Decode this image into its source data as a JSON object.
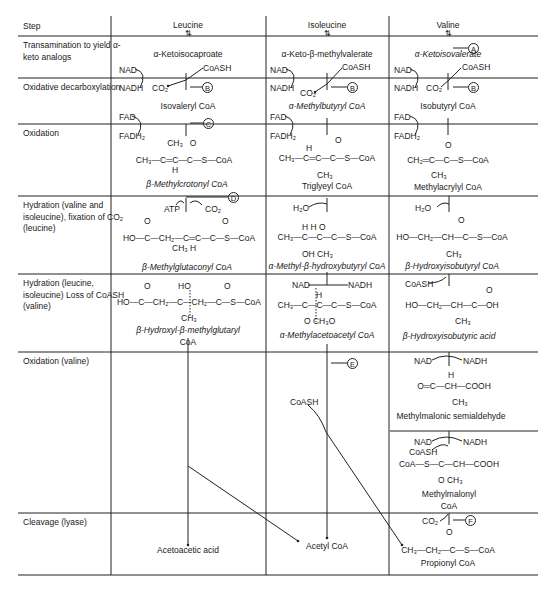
{
  "header": {
    "step": "Step",
    "columns": [
      "Leucine",
      "Isoleucine",
      "Valine"
    ]
  },
  "steps": [
    "Transamination to yield α-keto analogs",
    "Oxidative decarboxylation",
    "Oxidation",
    "Hydration (valine and isoleucine), fixation of CO₂ (leucine)",
    "Hydration (leucine, isoleucine) Loss of CoASH (valine)",
    "Oxidation (valine)",
    "Cleavage (lyase)"
  ],
  "markers": [
    "A",
    "B",
    "C",
    "D",
    "E",
    "F"
  ],
  "cofactors": {
    "nad": "NAD",
    "nadh": "NADH",
    "coash": "CoASH",
    "co2": "CO₂",
    "fad": "FAD",
    "fadh2": "FADH₂",
    "atp": "ATP",
    "h2o": "H₂O"
  },
  "leucine": {
    "keto": "α-Ketoisocaproate",
    "decarb": "Isovaleryl CoA",
    "oxid_struct": [
      "CH₃",
      "O",
      "CH₃—C═C—C—S—CoA",
      "H"
    ],
    "oxid": "β-Methylcrotonyl CoA",
    "hyd_struct": [
      "O",
      "O",
      "HO—C—CH₂—C═C—C—S—CoA",
      "CH₃  H"
    ],
    "hyd": "β-Methylglutaconyl CoA",
    "hmg_struct": [
      "O",
      "HO",
      "O",
      "HO—C—CH₂—C—CH₂—C—S—CoA",
      "CH₃"
    ],
    "hmg": "β-Hydroxyl-β-methylglutaryl",
    "hmg2": "CoA",
    "cleave": "Acetoacetic acid"
  },
  "isoleucine": {
    "keto": "α-Keto-β-methylvalerate",
    "decarb": "α-Methylbutyryl CoA",
    "oxid_struct": [
      "H",
      "O",
      "CH₃—C═C—C—S—CoA",
      "CH₃"
    ],
    "oxid": "Triglyeyl CoA",
    "hyd_struct": [
      "H   H   O",
      "CH₃—C—C—C—S—CoA",
      "OH CH₃"
    ],
    "hyd": "α-Methyl-β-hydroxybutyryl CoA",
    "mac_struct": [
      "H",
      "CH₃—C—C—C—S—CoA",
      "O  CH₃O"
    ],
    "mac": "α-Methylacetoacetyl CoA",
    "cleave": "Acetyl CoA"
  },
  "valine": {
    "keto": "α-Ketoisovalerate",
    "decarb": "Isobutyryl CoA",
    "oxid_struct": [
      "O",
      "CH₂═C—C—S—CoA",
      "CH₃"
    ],
    "oxid": "Methylacrylyl CoA",
    "hyd_struct": [
      "O",
      "HO—CH₂—CH—C—S—CoA",
      "CH₃"
    ],
    "hyd": "β-Hydroxyisobutyryl CoA",
    "acid_struct": [
      "O",
      "HO—CH₂—CH—C—OH",
      "CH₃"
    ],
    "acid": "β-Hydroxyisobutyric acid",
    "msa_struct": [
      "H",
      "O═C—CH—COOH",
      "CH₃"
    ],
    "msa": "Methylmalonic semialdehyde",
    "mmc_struct": [
      "CoA—S—C—CH—COOH",
      "O  CH₃"
    ],
    "mmc": "Methylmalonyl",
    "mmc2": "CoA",
    "prop_struct": [
      "O",
      "CH₃—CH₂—C—S—CoA"
    ],
    "prop": "Propionyl CoA"
  }
}
